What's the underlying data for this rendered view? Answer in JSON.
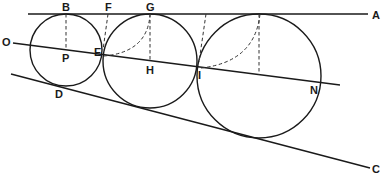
{
  "diagram": {
    "type": "geometric-construction",
    "labels": {
      "A": "A",
      "B": "B",
      "C": "C",
      "D": "D",
      "E": "E",
      "F": "F",
      "G": "G",
      "H": "H",
      "I": "I",
      "N": "N",
      "O": "O",
      "P": "P"
    },
    "lines": {
      "top_line": {
        "from": [
          28,
          14
        ],
        "to": [
          368,
          14
        ],
        "end_label": "A"
      },
      "bottom_line": {
        "from": [
          11,
          74
        ],
        "to": [
          370,
          168
        ],
        "end_label": "C"
      },
      "middle_line": {
        "from": [
          13,
          43
        ],
        "to": [
          340,
          85
        ],
        "start_label": "O"
      }
    },
    "circles": [
      {
        "name": "small",
        "cx": 66,
        "cy": 50,
        "r": 36
      },
      {
        "name": "middle",
        "cx": 150,
        "cy": 61,
        "r": 47
      },
      {
        "name": "large",
        "cx": 259,
        "cy": 76,
        "r": 62
      }
    ],
    "colors": {
      "stroke": "#1a1a1a",
      "background": "#ffffff"
    }
  }
}
